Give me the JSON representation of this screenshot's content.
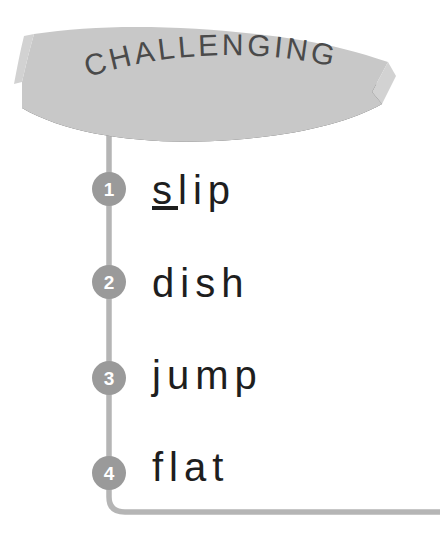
{
  "banner": {
    "title": "CHALLENGING",
    "fill_color": "#c8c8c8",
    "shadow_color": "#5a5a5a",
    "text_color": "#4a4a4a"
  },
  "timeline": {
    "line_color": "#b5b5b5",
    "marker_fill": "#9a9a9a",
    "marker_text_color": "#ffffff",
    "word_color": "#1e1e1e",
    "items": [
      {
        "number": "1",
        "word": "slip",
        "underlined_letter": "s",
        "rest": "lip"
      },
      {
        "number": "2",
        "word": "dish",
        "underlined_letter": "",
        "rest": "dish"
      },
      {
        "number": "3",
        "word": "jump",
        "underlined_letter": "",
        "rest": "jump"
      },
      {
        "number": "4",
        "word": "flat",
        "underlined_letter": "",
        "rest": "flat"
      }
    ]
  }
}
